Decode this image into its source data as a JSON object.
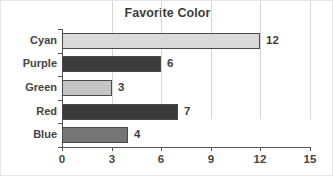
{
  "chart_data": {
    "type": "bar",
    "orientation": "horizontal",
    "title": "Favorite Color",
    "xlabel": "",
    "ylabel": "",
    "categories": [
      "Cyan",
      "Purple",
      "Green",
      "Red",
      "Blue"
    ],
    "values": [
      12,
      6,
      3,
      7,
      4
    ],
    "value_labels": [
      "12",
      "6",
      "3",
      "7",
      "4"
    ],
    "bar_colors": [
      "#d9d9d9",
      "#3d3d3d",
      "#c4c4c4",
      "#3a3a3a",
      "#757575"
    ],
    "bar_edge_color": "#4a4a4a",
    "xlim": [
      0,
      15
    ],
    "xticks": [
      0,
      3,
      6,
      9,
      12,
      15
    ],
    "xtick_labels": [
      "0",
      "3",
      "6",
      "9",
      "12",
      "15"
    ],
    "grid": "vertical",
    "gridline_color": "#d7d7d7",
    "axis_color": "#555555",
    "legend": "none",
    "background": "#ffffff",
    "title_color": "#3b3b3b",
    "label_color": "#444444"
  }
}
